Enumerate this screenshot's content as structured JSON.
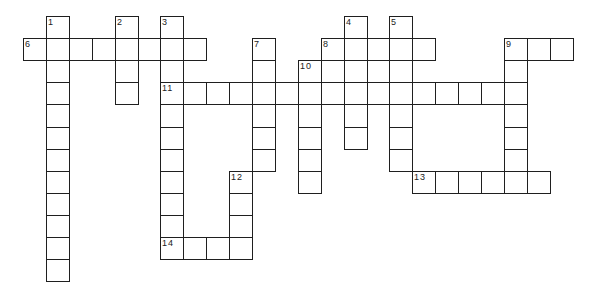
{
  "puzzle": {
    "type": "crossword",
    "grid_origin": {
      "x": 23,
      "y": 16
    },
    "cell_size": {
      "w": 22.9,
      "h": 22.1
    },
    "line_color": "#1f1f1f",
    "background": "#ffffff",
    "words": [
      {
        "number": "1",
        "direction": "down",
        "col": 1,
        "row": 0,
        "length": 12
      },
      {
        "number": "2",
        "direction": "down",
        "col": 4,
        "row": 0,
        "length": 4
      },
      {
        "number": "3",
        "direction": "down",
        "col": 6,
        "row": 0,
        "length": 11
      },
      {
        "number": "4",
        "direction": "down",
        "col": 14,
        "row": 0,
        "length": 6
      },
      {
        "number": "5",
        "direction": "down",
        "col": 16,
        "row": 0,
        "length": 7
      },
      {
        "number": "6",
        "direction": "across",
        "col": 0,
        "row": 1,
        "length": 8
      },
      {
        "number": "7",
        "direction": "down",
        "col": 10,
        "row": 1,
        "length": 6
      },
      {
        "number": "8",
        "direction": "across",
        "col": 13,
        "row": 1,
        "length": 5
      },
      {
        "number": "9",
        "direction": "across",
        "col": 21,
        "row": 1,
        "length": 3
      },
      {
        "number": "9",
        "direction": "down",
        "col": 21,
        "row": 1,
        "length": 7
      },
      {
        "number": "10",
        "direction": "down",
        "col": 12,
        "row": 2,
        "length": 6
      },
      {
        "number": "",
        "direction": "across",
        "col": 12,
        "row": 2,
        "length": 5
      },
      {
        "number": "11",
        "direction": "across",
        "col": 6,
        "row": 3,
        "length": 16
      },
      {
        "number": "12",
        "direction": "down",
        "col": 9,
        "row": 7,
        "length": 4
      },
      {
        "number": "13",
        "direction": "across",
        "col": 17,
        "row": 7,
        "length": 6
      },
      {
        "number": "14",
        "direction": "across",
        "col": 6,
        "row": 10,
        "length": 4
      }
    ],
    "labels": [
      {
        "text": "1",
        "col": 1,
        "row": 0
      },
      {
        "text": "2",
        "col": 4,
        "row": 0
      },
      {
        "text": "3",
        "col": 6,
        "row": 0
      },
      {
        "text": "4",
        "col": 14,
        "row": 0
      },
      {
        "text": "5",
        "col": 16,
        "row": 0
      },
      {
        "text": "6",
        "col": 0,
        "row": 1
      },
      {
        "text": "7",
        "col": 10,
        "row": 1
      },
      {
        "text": "8",
        "col": 13,
        "row": 1
      },
      {
        "text": "9",
        "col": 21,
        "row": 1
      },
      {
        "text": "10",
        "col": 12,
        "row": 2
      },
      {
        "text": "11",
        "col": 6,
        "row": 3
      },
      {
        "text": "12",
        "col": 9,
        "row": 7
      },
      {
        "text": "13",
        "col": 17,
        "row": 7
      },
      {
        "text": "14",
        "col": 6,
        "row": 10
      }
    ]
  }
}
